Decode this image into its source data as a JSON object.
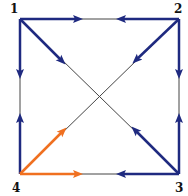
{
  "diagram": {
    "type": "directed-graph",
    "colors": {
      "primary_edge": "#1f2a80",
      "highlight_edge": "#f07020",
      "thin_line": "#444444",
      "background": "#ffffff"
    },
    "nodes": [
      {
        "id": "1",
        "label": "1",
        "x": 20,
        "y": 19
      },
      {
        "id": "2",
        "label": "2",
        "x": 179,
        "y": 19
      },
      {
        "id": "3",
        "label": "3",
        "x": 179,
        "y": 174
      },
      {
        "id": "4",
        "label": "4",
        "x": 20,
        "y": 174
      }
    ],
    "edges": [
      {
        "from": "1",
        "to": "2",
        "color": "blue",
        "arrows": [
          "toward 2 from 1",
          "toward 1 from 2"
        ]
      },
      {
        "from": "1",
        "to": "4",
        "color": "blue",
        "arrows": [
          "toward 4 from 1",
          "toward 1 from 4"
        ]
      },
      {
        "from": "2",
        "to": "3",
        "color": "blue",
        "arrows": [
          "toward 3 from 2",
          "toward 2 from 3"
        ]
      },
      {
        "from": "3",
        "to": "4",
        "color": "blue/orange",
        "arrows": [
          "toward 4 from 3 (blue)",
          "toward 3 from 4 (orange)"
        ]
      },
      {
        "from": "1",
        "to": "3",
        "color": "diagonal",
        "arrows": [
          "toward 3 from 1",
          "toward 1 from 3"
        ]
      },
      {
        "from": "2",
        "to": "4",
        "color": "diagonal",
        "arrows": [
          "toward 4 from 2",
          "toward 2 from 4 (orange)"
        ]
      }
    ]
  }
}
